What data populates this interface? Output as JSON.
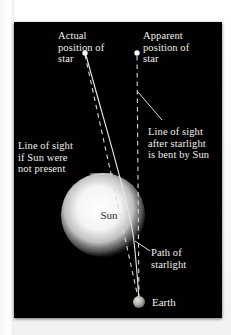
{
  "figure": {
    "background_color": "#010101",
    "mount_color": "#ffffff",
    "line_color": "#e8e6e2",
    "text_color": "#f2f0ec"
  },
  "labels": {
    "actual_position": "Actual\nposition of\nstar",
    "apparent_position": "Apparent\nposition of\nstar",
    "line_of_sight_no_sun": "Line of sight\nif Sun were\nnot present",
    "line_of_sight_bent": "Line of sight\nafter starlight\nis bent by Sun",
    "path_of_starlight": "Path of\nstarlight",
    "sun": "Sun",
    "earth": "Earth"
  },
  "bodies": {
    "sun": {
      "name": "Sun",
      "cx": 89,
      "cy": 193,
      "r": 31,
      "color": "#ffffff"
    },
    "earth": {
      "name": "Earth",
      "cx": 125,
      "cy": 280,
      "r": 6,
      "color": "#b9b7b2"
    },
    "actual_star": {
      "name": "Actual position of star",
      "cx": 71,
      "cy": 31,
      "r": 2.6,
      "color": "#ffffff"
    },
    "apparent_star": {
      "name": "Apparent position of star",
      "cx": 123,
      "cy": 31,
      "r": 2.6,
      "color": "#ffffff"
    }
  },
  "lines": {
    "path_of_starlight": {
      "style": "solid",
      "description": "Curved light ray from the actual star bending around the Sun to Earth"
    },
    "line_of_sight_no_sun": {
      "style": "dashed",
      "description": "Straight dashed line from the actual star through the Sun to Earth"
    },
    "line_of_sight_bent": {
      "style": "dashed",
      "description": "Vertical dashed line from the apparent star position down to Earth"
    }
  }
}
